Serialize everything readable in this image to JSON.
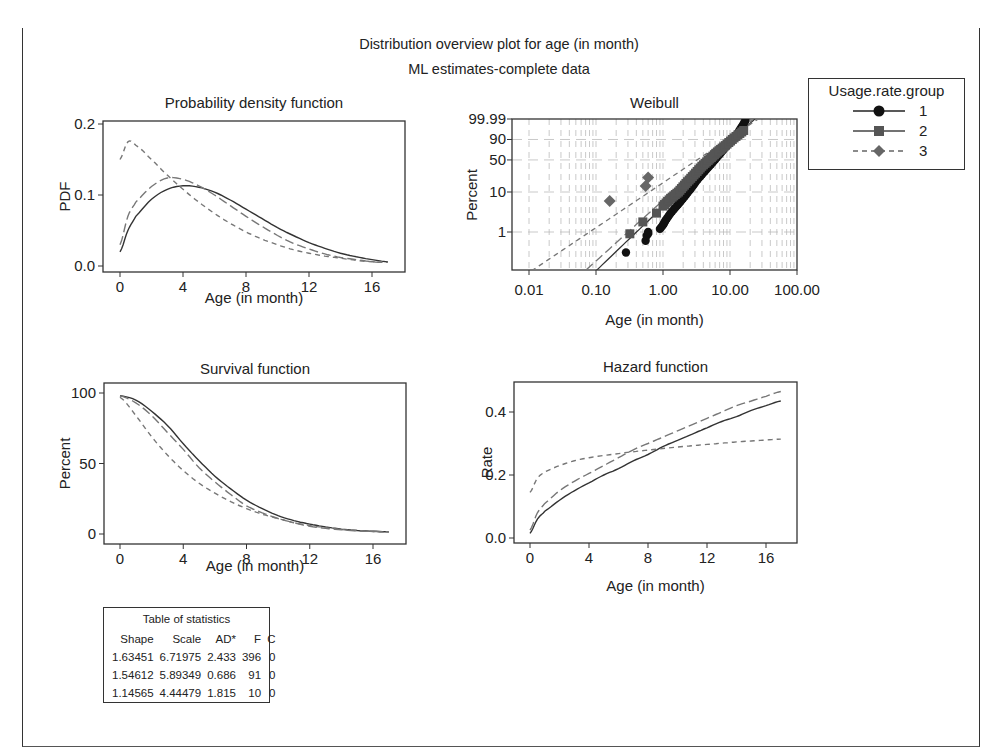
{
  "figure": {
    "title": "Distribution overview plot for age (in month)",
    "subtitle": "ML estimates-complete data"
  },
  "legend": {
    "title": "Usage.rate.group",
    "entries": [
      {
        "label": "1",
        "marker": "circle",
        "line": "solid"
      },
      {
        "label": "2",
        "marker": "square",
        "line": "long-dash"
      },
      {
        "label": "3",
        "marker": "diamond",
        "line": "short-dash"
      }
    ]
  },
  "stats_table": {
    "title": "Table of statistics",
    "headers": [
      "Shape",
      "Scale",
      "AD*",
      "F",
      "C"
    ],
    "rows": [
      [
        "1.63451",
        "6.71975",
        "2.433",
        "396",
        "0"
      ],
      [
        "1.54612",
        "5.89349",
        "0.686",
        "91",
        "0"
      ],
      [
        "1.14565",
        "4.44479",
        "1.815",
        "10",
        "0"
      ]
    ]
  },
  "colors": {
    "line": "#333333",
    "dash": "#777777",
    "grid": "#bbbbbb",
    "group1": "#111111",
    "group2": "#555555",
    "group3": "#666666"
  },
  "chart_data": [
    {
      "type": "line",
      "title": "Probability density function",
      "xlabel": "Age (in month)",
      "ylabel": "PDF",
      "xticks": [
        "0",
        "4",
        "8",
        "12",
        "16"
      ],
      "yticks": [
        "0.0",
        "0.1",
        "0.2"
      ],
      "xlim": [
        0,
        17
      ],
      "ylim": [
        0,
        0.2
      ],
      "x": [
        0,
        0.5,
        1,
        2,
        3,
        4,
        5,
        6,
        7,
        8,
        9,
        10,
        11,
        12,
        13,
        14,
        15,
        16,
        17
      ],
      "series": [
        {
          "name": "1",
          "values": [
            0.02,
            0.05,
            0.07,
            0.094,
            0.108,
            0.113,
            0.111,
            0.104,
            0.093,
            0.08,
            0.067,
            0.054,
            0.043,
            0.033,
            0.025,
            0.018,
            0.013,
            0.009,
            0.006
          ]
        },
        {
          "name": "2",
          "values": [
            0.03,
            0.07,
            0.09,
            0.112,
            0.124,
            0.122,
            0.113,
            0.1,
            0.085,
            0.07,
            0.056,
            0.043,
            0.032,
            0.024,
            0.017,
            0.012,
            0.009,
            0.006,
            0.005
          ]
        },
        {
          "name": "3",
          "values": [
            0.15,
            0.175,
            0.17,
            0.15,
            0.128,
            0.108,
            0.09,
            0.074,
            0.06,
            0.048,
            0.038,
            0.03,
            0.023,
            0.018,
            0.014,
            0.011,
            0.008,
            0.006,
            0.005
          ]
        }
      ]
    },
    {
      "type": "scatter",
      "title": "Weibull",
      "xlabel": "Age (in month)",
      "ylabel": "Percent",
      "xscale": "log",
      "yscale": "weibull",
      "xticks": [
        "0.01",
        "0.10",
        "1.00",
        "10.00",
        "100.00"
      ],
      "yticks": [
        "1",
        "10",
        "50",
        "90",
        "99.99"
      ],
      "xlim": [
        0.007,
        100
      ],
      "ylim": [
        0.1,
        99.99
      ],
      "grid": true,
      "fit_lines": [
        {
          "name": "1",
          "shape": 1.63451,
          "scale": 6.71975
        },
        {
          "name": "2",
          "shape": 1.54612,
          "scale": 5.89349
        },
        {
          "name": "3",
          "shape": 1.14565,
          "scale": 4.44479
        }
      ],
      "points": [
        {
          "name": "1",
          "x": [
            0.28,
            0.55,
            0.57,
            0.6,
            0.6,
            0.9,
            1.0,
            1.1,
            1.3,
            1.6,
            2.0,
            2.6,
            3.3,
            4.2,
            5.5,
            7.0,
            9.0,
            12.0,
            17.0
          ],
          "y": [
            0.3,
            0.6,
            0.8,
            0.9,
            1.0,
            1.2,
            1.5,
            2.0,
            3.0,
            4.5,
            7.0,
            12.0,
            20.0,
            30.0,
            45.0,
            62.0,
            80.0,
            93.0,
            99.9
          ]
        },
        {
          "name": "2",
          "x": [
            0.32,
            0.5,
            0.8,
            1.0,
            1.3,
            1.7,
            2.2,
            2.9,
            3.8,
            5.0,
            6.5,
            8.5,
            11.5,
            16.0
          ],
          "y": [
            0.9,
            1.8,
            3.0,
            4.5,
            7.0,
            10.0,
            16.0,
            25.0,
            38.0,
            52.0,
            67.0,
            80.0,
            92.0,
            98.0
          ]
        },
        {
          "name": "3",
          "x": [
            0.16,
            0.55,
            0.6
          ],
          "y": [
            6.0,
            14.0,
            22.0
          ]
        }
      ]
    },
    {
      "type": "line",
      "title": "Survival function",
      "xlabel": "Age (in month)",
      "ylabel": "Percent",
      "xticks": [
        "0",
        "4",
        "8",
        "12",
        "16"
      ],
      "yticks": [
        "0",
        "50",
        "100"
      ],
      "xlim": [
        0,
        17
      ],
      "ylim": [
        0,
        100
      ],
      "x": [
        0,
        1,
        2,
        3,
        4,
        5,
        6,
        7,
        8,
        9,
        10,
        11,
        12,
        13,
        14,
        15,
        16,
        17
      ],
      "series": [
        {
          "name": "1",
          "values": [
            98,
            95,
            87,
            77,
            64,
            52,
            41,
            32,
            24,
            18,
            13,
            9.5,
            7,
            5,
            3.5,
            2.5,
            2,
            1.5
          ]
        },
        {
          "name": "2",
          "values": [
            98,
            93,
            84,
            72,
            60,
            47,
            37,
            28,
            20,
            15,
            11,
            8,
            5.5,
            4,
            3,
            2.2,
            1.8,
            1.5
          ]
        },
        {
          "name": "3",
          "values": [
            97,
            84,
            69,
            56,
            45,
            36,
            29,
            23,
            18,
            14,
            11,
            8,
            6,
            4.5,
            3.2,
            2.4,
            1.8,
            1.4
          ]
        }
      ]
    },
    {
      "type": "line",
      "title": "Hazard function",
      "xlabel": "Age (in month)",
      "ylabel": "Rate",
      "xticks": [
        "0",
        "4",
        "8",
        "12",
        "16"
      ],
      "yticks": [
        "0.0",
        "0.2",
        "0.4"
      ],
      "xlim": [
        0,
        17
      ],
      "ylim": [
        0,
        0.48
      ],
      "x": [
        0,
        0.5,
        1,
        2,
        3,
        4,
        5,
        6,
        7,
        8,
        9,
        10,
        11,
        12,
        13,
        14,
        15,
        16,
        17
      ],
      "series": [
        {
          "name": "1",
          "values": [
            0.015,
            0.06,
            0.085,
            0.12,
            0.15,
            0.175,
            0.2,
            0.22,
            0.245,
            0.265,
            0.29,
            0.31,
            0.33,
            0.35,
            0.37,
            0.385,
            0.405,
            0.42,
            0.435
          ]
        },
        {
          "name": "2",
          "values": [
            0.025,
            0.08,
            0.11,
            0.15,
            0.18,
            0.205,
            0.23,
            0.255,
            0.28,
            0.3,
            0.32,
            0.34,
            0.36,
            0.38,
            0.4,
            0.42,
            0.435,
            0.45,
            0.465
          ]
        },
        {
          "name": "3",
          "values": [
            0.145,
            0.19,
            0.21,
            0.23,
            0.245,
            0.255,
            0.262,
            0.268,
            0.274,
            0.279,
            0.284,
            0.289,
            0.293,
            0.297,
            0.301,
            0.305,
            0.308,
            0.311,
            0.314
          ]
        }
      ]
    }
  ]
}
